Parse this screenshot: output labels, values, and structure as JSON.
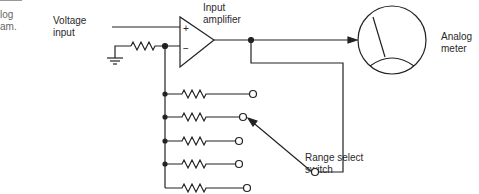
{
  "caption_fragment": {
    "line1": "log",
    "line2": "am."
  },
  "labels": {
    "voltage_input": [
      "Voltage",
      "input"
    ],
    "input_amplifier": [
      "Input",
      "amplifier"
    ],
    "analog_meter": [
      "Analog",
      "meter"
    ],
    "range_select_switch": [
      "Range select",
      "switch"
    ]
  },
  "opamp": {
    "plus": "+",
    "minus": "−"
  },
  "resistor_ladder": {
    "count": 5,
    "selected_index": 1
  }
}
